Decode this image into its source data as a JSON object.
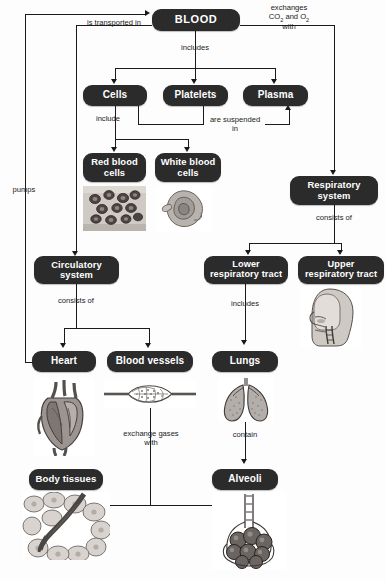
{
  "diagram": {
    "box_color": "#2b2b2b",
    "text_color": "#ffffff",
    "line_color": "#1a1a1a",
    "background": "#fdfdfd"
  },
  "nodes": {
    "blood": "BLOOD",
    "cells": "Cells",
    "platelets": "Platelets",
    "plasma": "Plasma",
    "red_blood_cells": "Red blood cells",
    "white_blood_cells": "White blood cells",
    "respiratory_system": "Respiratory system",
    "circulatory_system": "Circulatory system",
    "lower_respiratory_tract": "Lower respiratory tract",
    "upper_respiratory_tract": "Upper respiratory tract",
    "heart": "Heart",
    "blood_vessels": "Blood vessels",
    "lungs": "Lungs",
    "body_tissues": "Body tissues",
    "alveoli": "Alveoli"
  },
  "connectors": {
    "is_transported_in": "is transported in",
    "exchanges_gases_with_l1": "exchanges",
    "exchanges_gases_with_l2": "CO",
    "exchanges_gases_with_sub1": "2",
    "exchanges_gases_with_mid": " and O",
    "exchanges_gases_with_sub2": "2",
    "exchanges_gases_with_l3": "with",
    "includes_blood": "includes",
    "include": "include",
    "are_suspended_in": "are suspended in",
    "pumps": "pumps",
    "consists_of_circulatory": "consists of",
    "consists_of_respiratory": "consists of",
    "includes_lower": "includes",
    "exchange_gases_with": "exchange gases with",
    "contain": "contain"
  },
  "figures": {
    "red_blood_cells_micrograph": "red-blood-cells-micrograph",
    "white_blood_cell_micrograph": "white-blood-cell-micrograph",
    "head_airway_illustration": "upper-respiratory-tract-illustration",
    "heart_illustration": "heart-anatomy-illustration",
    "capillary_bed_illustration": "capillary-bed-illustration",
    "lungs_illustration": "lungs-illustration",
    "body_tissue_illustration": "body-tissue-capillary-illustration",
    "alveoli_illustration": "alveoli-cluster-illustration"
  }
}
